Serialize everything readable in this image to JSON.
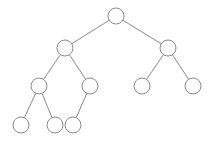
{
  "diagram": {
    "type": "binary-tree",
    "background": "#ffffff",
    "stroke_color": "#8a8a8a",
    "node_fill": "#ffffff",
    "node_radius": 8,
    "nodes": [
      {
        "id": "n1",
        "x": 116,
        "y": 16
      },
      {
        "id": "n2",
        "x": 65,
        "y": 48
      },
      {
        "id": "n3",
        "x": 168,
        "y": 48
      },
      {
        "id": "n4",
        "x": 39,
        "y": 86
      },
      {
        "id": "n5",
        "x": 90,
        "y": 86
      },
      {
        "id": "n6",
        "x": 142,
        "y": 86
      },
      {
        "id": "n7",
        "x": 193,
        "y": 86
      },
      {
        "id": "n8",
        "x": 21,
        "y": 125
      },
      {
        "id": "n9",
        "x": 55,
        "y": 125
      },
      {
        "id": "n10",
        "x": 73,
        "y": 125
      }
    ],
    "edges": [
      [
        "n1",
        "n2"
      ],
      [
        "n1",
        "n3"
      ],
      [
        "n2",
        "n4"
      ],
      [
        "n2",
        "n5"
      ],
      [
        "n3",
        "n6"
      ],
      [
        "n3",
        "n7"
      ],
      [
        "n4",
        "n8"
      ],
      [
        "n4",
        "n9"
      ],
      [
        "n5",
        "n10"
      ]
    ]
  }
}
